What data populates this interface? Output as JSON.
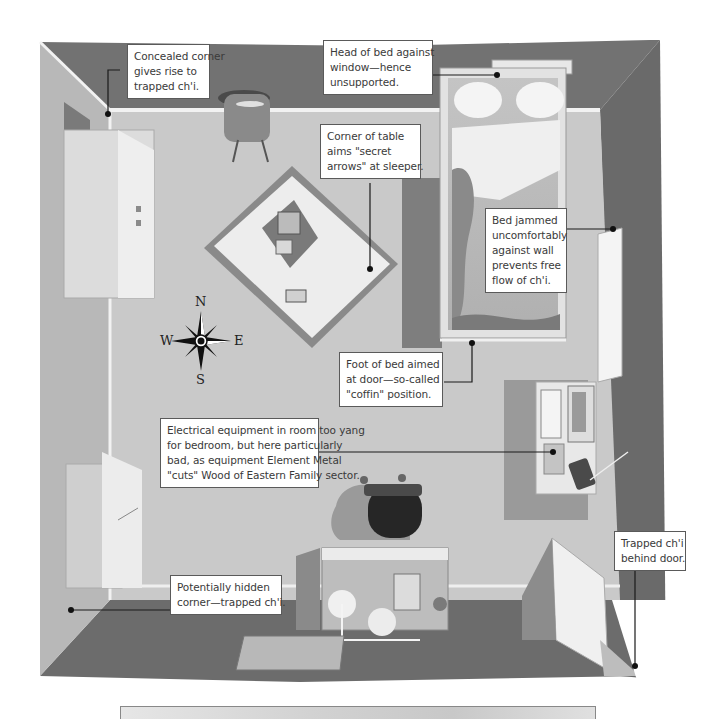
{
  "diagram": {
    "type": "annotated-floor-plan",
    "compass": {
      "north": "N",
      "south": "S",
      "east": "E",
      "west": "W"
    },
    "callouts": [
      {
        "id": "concealed-corner",
        "lines": [
          "Concealed corner",
          "gives rise to",
          "trapped ch'i."
        ]
      },
      {
        "id": "head-of-bed",
        "lines": [
          "Head of bed against",
          "window—hence",
          "unsupported."
        ]
      },
      {
        "id": "corner-of-table",
        "lines": [
          "Corner of table",
          "aims \"secret",
          "arrows\" at sleeper."
        ]
      },
      {
        "id": "bed-jammed",
        "lines": [
          "Bed jammed",
          "uncomfortably",
          "against wall",
          "prevents free",
          "flow of ch'i."
        ]
      },
      {
        "id": "foot-of-bed",
        "lines": [
          "Foot of bed aimed",
          "at door—so-called",
          "\"coffin\" position."
        ]
      },
      {
        "id": "electrical-equipment",
        "lines": [
          "Electrical equipment in room too yang",
          "for bedroom, but here particularly",
          "bad, as equipment Element Metal",
          "\"cuts\" Wood of Eastern Family sector."
        ]
      },
      {
        "id": "hidden-corner",
        "lines": [
          "Potentially hidden",
          "corner—trapped ch'i."
        ]
      },
      {
        "id": "behind-door",
        "lines": [
          "Trapped ch'i",
          "behind door."
        ]
      }
    ],
    "colors": {
      "floor": "#c9c9c9",
      "wall_dark": "#6e6e6e",
      "wall_light": "#9a9a9a",
      "furniture_light": "#e4e4e4",
      "leader_line": "#1a1a1a",
      "callout_border": "#5a5a5a"
    }
  }
}
